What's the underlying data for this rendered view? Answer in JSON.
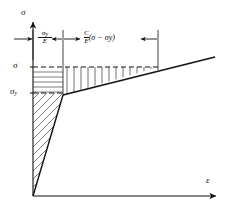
{
  "figure": {
    "type": "stress-strain-diagram",
    "title": "",
    "axes": {
      "y_label": "σ",
      "y_label_name": "sigma",
      "x_label": "ε",
      "x_label_name": "epsilon"
    },
    "level_labels": [
      {
        "text": "σ",
        "name": "stress-level-sigma"
      },
      {
        "text": "σ",
        "sub": "y",
        "name": "stress-level-sigma-y"
      }
    ],
    "dimensions": [
      {
        "name": "elastic-strain-dimension",
        "numerator": "σ",
        "numerator_sub": "y",
        "denominator": "E",
        "expression": "σy/E"
      },
      {
        "name": "plastic-strain-dimension",
        "numerator": "C",
        "denominator": "E",
        "paren": "(σ − σy)",
        "expression": "C/E (σ − σy)"
      }
    ],
    "regions": [
      {
        "name": "elastic-triangle",
        "hatch": "diagonal"
      },
      {
        "name": "upper-left-block",
        "hatch": "horizontal"
      },
      {
        "name": "hardening-wedge",
        "hatch": "vertical"
      }
    ],
    "colors": {
      "line": "#111111",
      "background": "#ffffff"
    }
  }
}
